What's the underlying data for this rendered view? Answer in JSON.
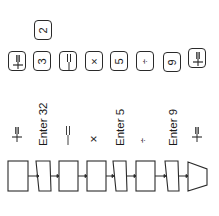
{
  "keys": {
    "top": {
      "label": "2"
    },
    "row": [
      {
        "label": "+=",
        "icon": "plus-equals"
      },
      {
        "label": "3"
      },
      {
        "label": "=",
        "icon": "equals-bar"
      },
      {
        "label": "×"
      },
      {
        "label": "5"
      },
      {
        "label": "÷"
      },
      {
        "label": "9"
      },
      {
        "label": "+=",
        "icon": "plus-equals"
      }
    ]
  },
  "steps": [
    {
      "label": "+="
    },
    {
      "label": "Enter 32"
    },
    {
      "label": "="
    },
    {
      "label": "×"
    },
    {
      "label": "Enter 5"
    },
    {
      "label": "÷"
    },
    {
      "label": "Enter 9"
    },
    {
      "label": "+="
    }
  ],
  "colors": {
    "stroke": "#2a2a2a",
    "background": "#ffffff"
  }
}
